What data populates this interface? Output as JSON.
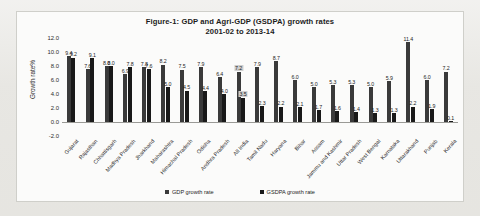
{
  "chart_data": {
    "type": "bar",
    "title": "Figure-1: GDP and Agri-GDP (GSDPA) growth rates",
    "subtitle": "2001-02 to 2013-14",
    "xlabel": "",
    "ylabel": "Growth rate%",
    "ylim": [
      -2.0,
      12.0
    ],
    "ytick_step": 2.0,
    "yticks": [
      "12.0",
      "10.0",
      "8.0",
      "6.0",
      "4.0",
      "2.0",
      "0.0",
      "-2.0"
    ],
    "grid": false,
    "legend_position": "bottom",
    "highlighted_category": "All India",
    "categories": [
      "Gujarat",
      "Rajasthan",
      "Chhattisgarh",
      "Madhya Pradesh",
      "Jharkhand",
      "Maharashtra",
      "Himachal Pradesh",
      "Odisha",
      "Andhra Pradesh",
      "All India",
      "Tamil Nadu",
      "Haryana",
      "Bihar",
      "Assam",
      "Jammu and Kashmir",
      "Uttar Pradesh",
      "West Bengal",
      "Karnataka",
      "Uttarakhand",
      "Punjab",
      "Kerala"
    ],
    "series": [
      {
        "name": "GDP growth rate",
        "values": [
          9.4,
          7.6,
          8.0,
          6.9,
          7.8,
          8.2,
          7.5,
          6.4,
          7.2,
          7.9,
          6.7,
          6.0,
          5.0,
          5.3,
          5.9,
          7.1,
          11.4,
          6.0,
          7.2,
          9.2,
          9.1
        ]
      },
      {
        "name": "GSDPA growth rate",
        "values": [
          9.2,
          9.1,
          8.0,
          7.8,
          7.6,
          5.0,
          4.5,
          4.4,
          3.5,
          2.3,
          2.2,
          2.1,
          1.7,
          1.6,
          1.4,
          1.3,
          2.2,
          1.9,
          0.1,
          6.3,
          7.6
        ]
      }
    ],
    "bars": [
      {
        "category": "Gujarat",
        "gdp": 9.4,
        "gsdpa": 9.2,
        "gdp_label": "9.4",
        "gsdpa_label": "9.2"
      },
      {
        "category": "Rajasthan",
        "gdp": 7.6,
        "gsdpa": 9.1,
        "gdp_label": "7.6",
        "gsdpa_label": "9.1"
      },
      {
        "category": "Chhattisgarh",
        "gdp": 8.0,
        "gsdpa": 8.0,
        "gdp_label": "8.0",
        "gsdpa_label": "8.0"
      },
      {
        "category": "Madhya Pradesh",
        "gdp": 6.9,
        "gsdpa": 7.8,
        "gdp_label": "6.9",
        "gsdpa_label": "7.8"
      },
      {
        "category": "Jharkhand",
        "gdp": 7.8,
        "gsdpa": 7.6,
        "gdp_label": "7.8",
        "gsdpa_label": "7.6"
      },
      {
        "category": "Maharashtra",
        "gdp": 8.2,
        "gsdpa": 5.0,
        "gdp_label": "8.2",
        "gsdpa_label": "5.0"
      },
      {
        "category": "Himachal Pradesh",
        "gdp": 7.5,
        "gsdpa": 4.5,
        "gdp_label": "7.5",
        "gsdpa_label": "4.5"
      },
      {
        "category": "Odisha",
        "gdp": 7.9,
        "gsdpa": 4.4,
        "gdp_label": "7.9",
        "gsdpa_label": "4.4"
      },
      {
        "category": "Andhra Pradesh",
        "gdp": 6.4,
        "gsdpa": 4.0,
        "gdp_label": "6.4",
        "gsdpa_label": "4.0"
      },
      {
        "category": "All India",
        "gdp": 7.2,
        "gsdpa": 3.5,
        "gdp_label": "7.2",
        "gsdpa_label": "3.5",
        "highlight": true
      },
      {
        "category": "Tamil Nadu",
        "gdp": 7.9,
        "gsdpa": 2.3,
        "gdp_label": "7.9",
        "gsdpa_label": "2.3"
      },
      {
        "category": "Haryana",
        "gdp": 8.7,
        "gsdpa": 2.2,
        "gdp_label": "8.7",
        "gsdpa_label": "2.2"
      },
      {
        "category": "Bihar",
        "gdp": 6.0,
        "gsdpa": 2.1,
        "gdp_label": "6.0",
        "gsdpa_label": "2.1"
      },
      {
        "category": "Assam",
        "gdp": 5.0,
        "gsdpa": 1.7,
        "gdp_label": "5.0",
        "gsdpa_label": "1.7"
      },
      {
        "category": "Jammu and Kashmir",
        "gdp": 5.3,
        "gsdpa": 1.6,
        "gdp_label": "5.3",
        "gsdpa_label": "1.6"
      },
      {
        "category": "Uttar Pradesh",
        "gdp": 5.3,
        "gsdpa": 1.4,
        "gdp_label": "5.3",
        "gsdpa_label": "1.4"
      },
      {
        "category": "West Bengal",
        "gdp": 5.0,
        "gsdpa": 1.3,
        "gdp_label": "5.0",
        "gsdpa_label": "1.3"
      },
      {
        "category": "Karnataka",
        "gdp": 5.9,
        "gsdpa": 1.3,
        "gdp_label": "5.9",
        "gsdpa_label": "1.3"
      },
      {
        "category": "Uttarakhand",
        "gdp": 11.4,
        "gsdpa": 2.2,
        "gdp_label": "11.4",
        "gsdpa_label": "2.2"
      },
      {
        "category": "Punjab",
        "gdp": 6.0,
        "gsdpa": 1.9,
        "gdp_label": "6.0",
        "gsdpa_label": "1.9"
      },
      {
        "category": "Kerala",
        "gdp": 7.2,
        "gsdpa": 0.1,
        "gdp_label": "7.2",
        "gsdpa_label": "0.1"
      }
    ],
    "legend": [
      {
        "label": "GDP growth rate",
        "color": "#3a3a3a"
      },
      {
        "label": "GSDPA growth rate",
        "color": "#191919"
      }
    ]
  }
}
